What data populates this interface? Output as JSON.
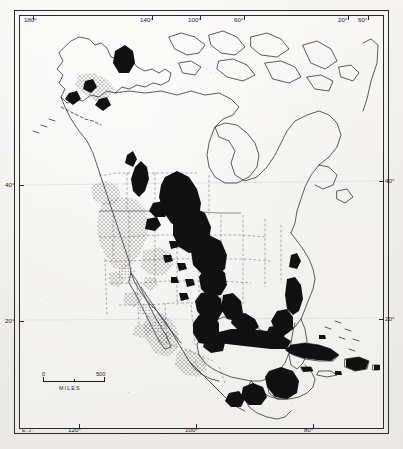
{
  "figure": {
    "domain": "map",
    "projection_note": "Conic projection, North America with Caribbean",
    "background_color": "#f2f1ee",
    "ink_color": "#1d1d1d"
  },
  "frame": {
    "style": "double neat-line"
  },
  "graticule": {
    "top_labels": [
      {
        "text": "180°",
        "x": 24,
        "y": 18
      },
      {
        "text": "140°",
        "x": 140,
        "y": 18
      },
      {
        "text": "100°",
        "x": 188,
        "y": 18
      },
      {
        "text": "60°",
        "x": 232,
        "y": 18
      },
      {
        "text": "20°",
        "x": 349,
        "y": 18
      },
      {
        "text": "60°",
        "x": 369,
        "y": 18
      }
    ],
    "left_labels": [
      {
        "text": "40°",
        "x": 6,
        "y": 185
      },
      {
        "text": "20°",
        "x": 6,
        "y": 321
      }
    ],
    "right_labels": [
      {
        "text": "40°",
        "x": 384,
        "y": 181
      },
      {
        "text": "20°",
        "x": 384,
        "y": 319
      }
    ],
    "bottom_labels": [
      {
        "text": "120°",
        "x": 69,
        "y": 431
      },
      {
        "text": "100°",
        "x": 185,
        "y": 431
      },
      {
        "text": "80°",
        "x": 303,
        "y": 431
      }
    ]
  },
  "scale_bar": {
    "min_label": "0",
    "max_label": "500",
    "units_label": "MILES"
  },
  "corner_mark": {
    "text": "E.J."
  },
  "legend_symbols": [
    {
      "name": "solid-range",
      "description": "Solid black fill — primary distribution area",
      "color": "#111111"
    },
    {
      "name": "stippled-range",
      "description": "Stippled / dotted fill — secondary or scattered occurrence",
      "color": "#2a2a2a"
    }
  ],
  "regions": {
    "solid_black_areas": [
      "Alaska — Seward Peninsula / Norton Sound",
      "Northern Rocky Mountains — Montana / Idaho",
      "Wyoming Basin",
      "Central Great Plains — Nebraska / Kansas / Oklahoma",
      "Texas Panhandle and Edwards Plateau",
      "Lower Mississippi Valley",
      "Gulf Coastal Plain",
      "Atlantic Coastal Plain — Carolinas to Florida",
      "Yucatan Peninsula",
      "Cuba and Hispaniola"
    ],
    "stippled_areas": [
      "Great Basin — Nevada / Utah",
      "Columbia Plateau",
      "Colorado Plateau",
      "Sierra Madre Occidental",
      "Central Mexican Plateau",
      "Alaska Peninsula / Aleutian margin"
    ]
  }
}
